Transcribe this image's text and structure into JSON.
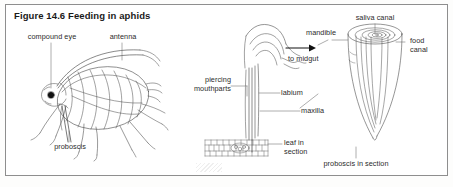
{
  "figure": {
    "number": "Figure 14.6",
    "title": "Figure 14.6  Feeding in aphids",
    "caption_text": "Feeding in aphids",
    "border_color": "#8e8e8e",
    "ink_color": "#4a4a4a",
    "text_color": "#2b2b2b"
  },
  "left_diagram": {
    "name": "whole aphid side view",
    "labels": {
      "compound_eye": "compound eye",
      "antenna": "antenna",
      "proboscis": "proboscis"
    }
  },
  "right_diagram": {
    "name": "aphid mouthparts and proboscis section",
    "labels": {
      "piercing_mouthparts_line1": "piercing",
      "piercing_mouthparts_line2": "mouthparts",
      "to_midgut": "to midgut",
      "labium": "labium",
      "maxilla": "maxilla",
      "mandible": "mandible",
      "saliva_canal": "saliva canal",
      "food_canal_line1": "food",
      "food_canal_line2": "canal",
      "leaf_in_section_line1": "leaf in",
      "leaf_in_section_line2": "section",
      "proboscis_in_section": "proboscis in section"
    }
  }
}
